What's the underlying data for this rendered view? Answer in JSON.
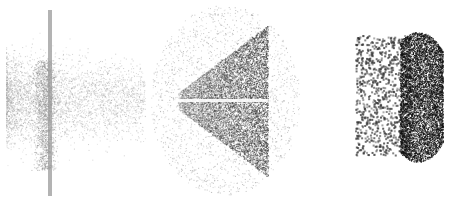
{
  "figure": {
    "width": 456,
    "height": 202,
    "background": "#ffffff",
    "panels": [
      {
        "id": "left-cloud",
        "description": "light gray particle cloud with vertical bar",
        "color": "#a0a0a0",
        "bar_x": 50,
        "bar_y": [
          10,
          196
        ],
        "center": [
          45,
          100
        ],
        "extent_x": [
          6,
          145
        ],
        "extent_y": [
          30,
          180
        ]
      },
      {
        "id": "middle-cone",
        "description": "dark gray cone/fan shape pointing left with bright horizontal streak",
        "color": "#3a3a3a",
        "apex": [
          178,
          101
        ],
        "right_edge_x": 268,
        "extent_y": [
          25,
          175
        ],
        "halo_extent": [
          150,
          300,
          5,
          195
        ]
      },
      {
        "id": "right-blob",
        "description": "black dense lens-shaped blob with scattered dots to the left",
        "color": "#111111",
        "center": [
          420,
          100
        ],
        "extent_x": [
          355,
          445
        ],
        "extent_y": [
          30,
          160
        ]
      }
    ]
  }
}
